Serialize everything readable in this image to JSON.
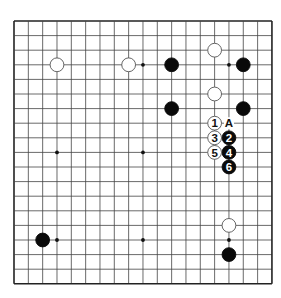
{
  "board": {
    "size": 19,
    "origin": {
      "x": 14,
      "y": 21
    },
    "spacing": {
      "x": 14.33,
      "y": 14.6
    },
    "line_color": "#444444",
    "edge_color": "#222222",
    "star_points": [
      [
        3,
        3
      ],
      [
        9,
        3
      ],
      [
        15,
        3
      ],
      [
        3,
        9
      ],
      [
        9,
        9
      ],
      [
        15,
        9
      ],
      [
        3,
        15
      ],
      [
        9,
        15
      ],
      [
        15,
        15
      ]
    ]
  },
  "stones": [
    {
      "color": "white",
      "col": 3,
      "row": 3
    },
    {
      "color": "white",
      "col": 8,
      "row": 3
    },
    {
      "color": "black",
      "col": 11,
      "row": 3
    },
    {
      "color": "white",
      "col": 14,
      "row": 2
    },
    {
      "color": "black",
      "col": 16,
      "row": 3
    },
    {
      "color": "black",
      "col": 11,
      "row": 6
    },
    {
      "color": "white",
      "col": 14,
      "row": 5
    },
    {
      "color": "black",
      "col": 16,
      "row": 6
    },
    {
      "color": "black",
      "col": 2,
      "row": 15
    },
    {
      "color": "white",
      "col": 15,
      "row": 14
    },
    {
      "color": "black",
      "col": 15,
      "row": 16
    }
  ],
  "moves": [
    {
      "number": "1",
      "color": "white",
      "col": 14,
      "row": 7
    },
    {
      "number": "2",
      "color": "black",
      "col": 15,
      "row": 8
    },
    {
      "number": "3",
      "color": "white",
      "col": 14,
      "row": 8
    },
    {
      "number": "4",
      "color": "black",
      "col": 15,
      "row": 9
    },
    {
      "number": "5",
      "color": "white",
      "col": 14,
      "row": 9
    },
    {
      "number": "6",
      "color": "black",
      "col": 15,
      "row": 10
    }
  ],
  "labels": [
    {
      "text": "A",
      "col": 15,
      "row": 7
    }
  ]
}
